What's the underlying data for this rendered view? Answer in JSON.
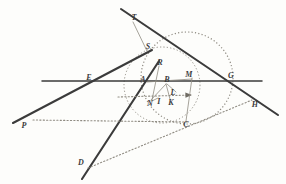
{
  "figure": {
    "width": 286,
    "height": 184,
    "background_color": "#fdfdfb",
    "ink_color": "#3b3b3b",
    "light_ink_color": "#8f8b82"
  },
  "labels": [
    {
      "id": "T",
      "text": "T",
      "x": 134,
      "y": 18,
      "size": 8
    },
    {
      "id": "S",
      "text": "S",
      "x": 148,
      "y": 47,
      "size": 8
    },
    {
      "id": "R",
      "text": "R",
      "x": 160,
      "y": 63,
      "size": 8
    },
    {
      "id": "E",
      "text": "E",
      "x": 89,
      "y": 78,
      "size": 8
    },
    {
      "id": "A",
      "text": "A",
      "x": 143,
      "y": 80,
      "size": 8
    },
    {
      "id": "B",
      "text": "B",
      "x": 167,
      "y": 80,
      "size": 8
    },
    {
      "id": "M",
      "text": "M",
      "x": 189,
      "y": 75,
      "size": 8
    },
    {
      "id": "G",
      "text": "G",
      "x": 231,
      "y": 76,
      "size": 8
    },
    {
      "id": "L",
      "text": "L",
      "x": 173,
      "y": 93,
      "size": 8
    },
    {
      "id": "N",
      "text": "N",
      "x": 150,
      "y": 104,
      "size": 8
    },
    {
      "id": "I",
      "text": "I",
      "x": 159,
      "y": 102,
      "size": 8
    },
    {
      "id": "K",
      "text": "K",
      "x": 171,
      "y": 103,
      "size": 8
    },
    {
      "id": "H",
      "text": "H",
      "x": 255,
      "y": 105,
      "size": 8
    },
    {
      "id": "P",
      "text": "P",
      "x": 24,
      "y": 126,
      "size": 8
    },
    {
      "id": "C",
      "text": "C",
      "x": 186,
      "y": 125,
      "size": 8
    },
    {
      "id": "D",
      "text": "D",
      "x": 81,
      "y": 163,
      "size": 8
    }
  ],
  "lines": [
    {
      "id": "horizontal-axis",
      "kind": "solid",
      "x1": 42,
      "y1": 81,
      "x2": 262,
      "y2": 81,
      "width": 1.5
    },
    {
      "id": "line-T-to-H",
      "kind": "solid",
      "x1": 121,
      "y1": 9,
      "x2": 278,
      "y2": 115,
      "width": 2.1
    },
    {
      "id": "line-P-to-S",
      "kind": "solid",
      "x1": 13,
      "y1": 123,
      "x2": 152,
      "y2": 50,
      "width": 2.1
    },
    {
      "id": "line-D-to-R",
      "kind": "solid",
      "x1": 82,
      "y1": 179,
      "x2": 159,
      "y2": 61,
      "width": 2.1
    },
    {
      "id": "line-P-to-C-dotted",
      "kind": "dotted",
      "x1": 33,
      "y1": 120,
      "x2": 188,
      "y2": 122,
      "width": 1.1
    },
    {
      "id": "line-D-to-H-dotted",
      "kind": "dotted",
      "x1": 88,
      "y1": 168,
      "x2": 252,
      "y2": 100,
      "width": 1.1
    },
    {
      "id": "line-N-to-arrow-dotted",
      "kind": "dotted",
      "x1": 118,
      "y1": 97,
      "x2": 192,
      "y2": 95,
      "width": 1.1,
      "arrow": "right"
    },
    {
      "id": "segment-T-to-S",
      "kind": "thin",
      "x1": 133,
      "y1": 22,
      "x2": 147,
      "y2": 51,
      "width": 0.8
    },
    {
      "id": "segment-A-to-M",
      "kind": "thin",
      "x1": 147,
      "y1": 82,
      "x2": 192,
      "y2": 79,
      "width": 0.8
    },
    {
      "id": "segment-B-to-N",
      "kind": "thin",
      "x1": 166,
      "y1": 84,
      "x2": 151,
      "y2": 100,
      "width": 0.8
    },
    {
      "id": "segment-B-to-K",
      "kind": "thin",
      "x1": 166,
      "y1": 84,
      "x2": 170,
      "y2": 99,
      "width": 0.8
    },
    {
      "id": "segment-B-to-L",
      "kind": "thin",
      "x1": 167,
      "y1": 84,
      "x2": 176,
      "y2": 92,
      "width": 0.8
    },
    {
      "id": "segment-N-to-I",
      "kind": "thin",
      "x1": 152,
      "y1": 101,
      "x2": 158,
      "y2": 98,
      "width": 0.8
    },
    {
      "id": "segment-M-to-C",
      "kind": "thin",
      "x1": 192,
      "y1": 78,
      "x2": 186,
      "y2": 121,
      "width": 0.8
    },
    {
      "id": "segment-R-to-N",
      "kind": "thin",
      "x1": 159,
      "y1": 66,
      "x2": 152,
      "y2": 100,
      "width": 0.8
    }
  ],
  "circles": [
    {
      "id": "large-dotted-circle",
      "kind": "dotted",
      "cx": 187,
      "cy": 78,
      "r": 46,
      "width": 1.2
    },
    {
      "id": "small-dotted-circle",
      "kind": "dotted",
      "cx": 162,
      "cy": 85,
      "r": 38,
      "width": 1.0
    }
  ]
}
